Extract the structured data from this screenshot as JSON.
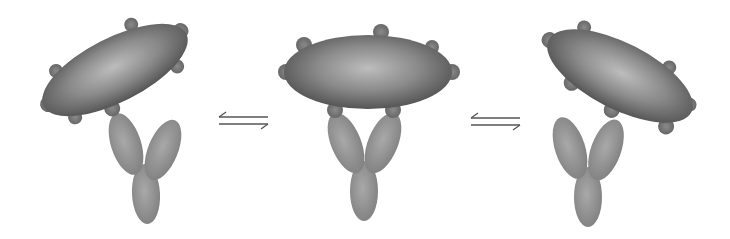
{
  "diagram": {
    "type": "conformational-equilibrium",
    "states": [
      {
        "id": "state-1",
        "label": "particle tilted left-up, antibody arms lower-left"
      },
      {
        "id": "state-2",
        "label": "particle horizontal, antibody symmetric below"
      },
      {
        "id": "state-3",
        "label": "particle tilted right-down, antibody arms left"
      }
    ],
    "arrows": [
      {
        "id": "equilibrium-1",
        "symbol": "⇌",
        "between": [
          "state-1",
          "state-2"
        ]
      },
      {
        "id": "equilibrium-2",
        "symbol": "⇌",
        "between": [
          "state-2",
          "state-3"
        ]
      }
    ],
    "colors": {
      "background": "#ffffff",
      "particle_dark": "#5a5a5a",
      "particle_light": "#b8b8b8",
      "antibody": "#8a8a8a",
      "antibody_light": "#a8a8a8",
      "spike": "#6e6e6e",
      "arrow": "#555555"
    }
  }
}
